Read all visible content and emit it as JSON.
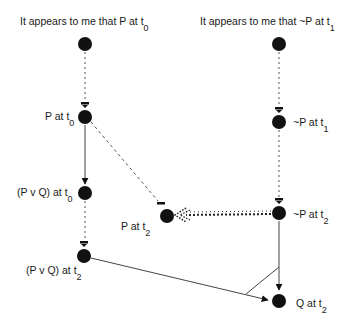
{
  "diagram": {
    "colors": {
      "node": "#111111",
      "edge": "#444444",
      "text": "#1a1a1a",
      "background": "#ffffff"
    },
    "nodes": [
      {
        "id": "appears_p_t0",
        "text": "It appears to me that P at t",
        "sub": "0",
        "x": 85,
        "y": 44
      },
      {
        "id": "appears_notp_t1",
        "text": "It appears to me that ~P at t",
        "sub": "1",
        "x": 279,
        "y": 44
      },
      {
        "id": "p_t0",
        "text": "P at t",
        "sub": "0",
        "x": 85,
        "y": 117
      },
      {
        "id": "notp_t1",
        "text": "~P at t",
        "sub": "1",
        "x": 279,
        "y": 122
      },
      {
        "id": "pvq_t0",
        "text": "(P v Q) at t",
        "sub": "0",
        "x": 85,
        "y": 193
      },
      {
        "id": "p_t2",
        "text": "P at t",
        "sub": "2",
        "x": 167,
        "y": 216
      },
      {
        "id": "notp_t2",
        "text": "~P at t",
        "sub": "2",
        "x": 279,
        "y": 213
      },
      {
        "id": "pvq_t2",
        "text": "(P v Q) at t",
        "sub": "2",
        "x": 84,
        "y": 256
      },
      {
        "id": "q_t2",
        "text": "Q at t",
        "sub": "2",
        "x": 279,
        "y": 301
      }
    ],
    "edges": [
      {
        "from": "appears_p_t0",
        "to": "p_t0",
        "style": "dotted",
        "head": "bar"
      },
      {
        "from": "appears_notp_t1",
        "to": "notp_t1",
        "style": "dotted",
        "head": "bar"
      },
      {
        "from": "p_t0",
        "to": "pvq_t0",
        "style": "solid",
        "head": "arrow"
      },
      {
        "from": "p_t0",
        "to": "p_t2",
        "style": "dashed",
        "head": "bar"
      },
      {
        "from": "notp_t1",
        "to": "notp_t2",
        "style": "dotted",
        "head": "bar"
      },
      {
        "from": "pvq_t0",
        "to": "pvq_t2",
        "style": "dotted",
        "head": "bar"
      },
      {
        "from": "notp_t2",
        "to": "p_t2",
        "style": "thick-dotted",
        "head": "hollow-dotted-arrow"
      },
      {
        "from": "notp_t2",
        "to": "q_t2",
        "style": "solid",
        "head": "arrow",
        "joined_with": "pvq_t2"
      },
      {
        "from": "pvq_t2",
        "to": "q_t2",
        "style": "solid",
        "head": "arrow",
        "joined_with": "notp_t2"
      }
    ]
  }
}
